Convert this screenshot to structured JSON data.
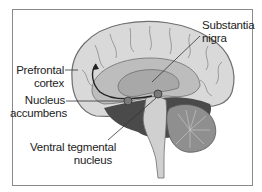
{
  "diagram": {
    "title": "",
    "type": "brain-sagittal-section",
    "labels": {
      "prefrontal_cortex": {
        "line1": "Prefrontal",
        "line2": "cortex"
      },
      "nucleus_accumbens": {
        "line1": "Nucleus",
        "line2": "accumbens"
      },
      "substantia_nigra": {
        "line1": "Substantia",
        "line2": "nigra"
      },
      "ventral_tegmental": {
        "line1": "Ventral tegmental",
        "line2": "nucleus"
      }
    },
    "colors": {
      "cortex": "#d9d9d9",
      "cortex_outline": "#6e6e6e",
      "inner": "#a8a8a8",
      "dark_region": "#4a4a4a",
      "brainstem": "#d0d0d0",
      "cerebellum": "#8f8f8f",
      "frame": "#8a8a8a"
    }
  }
}
